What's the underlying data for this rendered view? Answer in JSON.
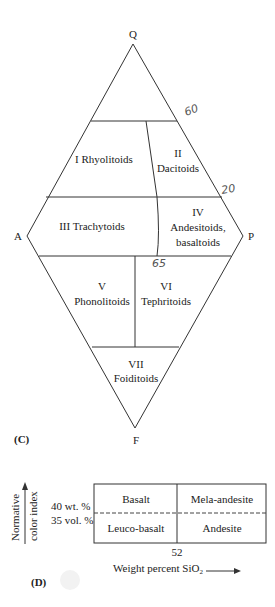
{
  "diagram_c": {
    "panel_label": "(C)",
    "vertices": {
      "top": "Q",
      "left": "A",
      "right": "P",
      "bottom": "F"
    },
    "fields": [
      {
        "id": "I",
        "numeral": "I",
        "name": "Rhyolitoids",
        "label": "I Rhyolitoids"
      },
      {
        "id": "II",
        "numeral": "II",
        "name": "Dacitoids"
      },
      {
        "id": "III",
        "numeral": "III",
        "name": "Trachytoids",
        "label": "III Trachytoids"
      },
      {
        "id": "IV",
        "numeral": "IV",
        "name_line1": "Andesitoids,",
        "name_line2": "basaltoids"
      },
      {
        "id": "V",
        "numeral": "V",
        "name": "Phonolitoids"
      },
      {
        "id": "VI",
        "numeral": "VI",
        "name": "Tephritoids"
      },
      {
        "id": "VII",
        "numeral": "VII",
        "name": "Foiditoids"
      }
    ],
    "annotations": {
      "q60": "60",
      "q20": "20",
      "p65": "65"
    }
  },
  "diagram_d": {
    "panel_label": "(D)",
    "y_axis_label_line1": "Normative",
    "y_axis_label_line2": "color index",
    "y_ticks": [
      "40 wt. %",
      "35 vol. %"
    ],
    "cells": {
      "top_left": "Basalt",
      "top_right": "Mela-andesite",
      "bottom_left": "Leuco-basalt",
      "bottom_right": "Andesite"
    },
    "x_tick": "52",
    "x_axis_label": "Weight percent SiO",
    "x_axis_subscript": "2"
  }
}
